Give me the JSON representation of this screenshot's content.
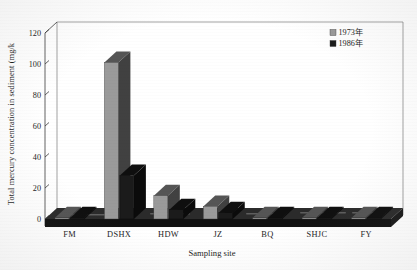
{
  "chart_data": {
    "type": "bar",
    "title": "",
    "subtitle": "",
    "xlabel": "Sampling site",
    "ylabel": "Total mercury concentration in sediment (mg/k",
    "categories": [
      "FM",
      "DSHX",
      "HDW",
      "JZ",
      "BQ",
      "SHJC",
      "FY"
    ],
    "series": [
      {
        "name": "1973年",
        "color": "#9a9a9a",
        "values": [
          0.4,
          101,
          15,
          8,
          0.3,
          0.3,
          0.3
        ]
      },
      {
        "name": "1986年",
        "color": "#1b1b1b",
        "values": [
          0.3,
          28,
          6,
          4,
          0.2,
          0.2,
          0.2
        ]
      }
    ],
    "ylim": [
      0,
      120
    ],
    "yticks": [
      0,
      20,
      40,
      60,
      80,
      100,
      120
    ],
    "ytick_labels": [
      "0",
      "20",
      "40",
      "60",
      "80",
      "100",
      "120"
    ],
    "grid": false,
    "legend_position": "top-right",
    "style": "3d-perspective",
    "annotations": []
  },
  "legend": {
    "entries": [
      {
        "label": "1973年",
        "swatch": "#9a9a9a"
      },
      {
        "label": "1986年",
        "swatch": "#1b1b1b"
      }
    ]
  },
  "colors": {
    "series_1973": "#9a9a9a",
    "series_1986": "#1b1b1b",
    "floor": "#1e1e1e",
    "wall": "#8a8a8a",
    "axis": "#3a3a3a",
    "background": "#ffffff"
  }
}
